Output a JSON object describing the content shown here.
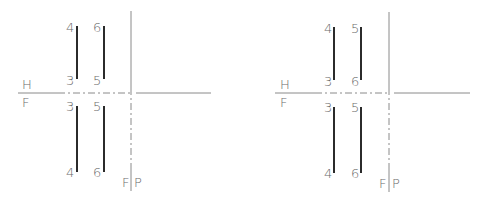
{
  "diagrams": [
    {
      "name": "left",
      "plane_labels": {
        "hf_top": "H",
        "hf_bottom": "F",
        "fp_left": "F",
        "fp_right": "P"
      },
      "top_view": {
        "line_a": {
          "top": "4",
          "bottom": "3"
        },
        "line_b": {
          "top": "6",
          "bottom": "5"
        }
      },
      "front_view": {
        "line_a": {
          "top": "3",
          "bottom": "4"
        },
        "line_b": {
          "top": "5",
          "bottom": "6"
        }
      }
    },
    {
      "name": "right",
      "plane_labels": {
        "hf_top": "H",
        "hf_bottom": "F",
        "fp_left": "F",
        "fp_right": "P"
      },
      "top_view": {
        "line_a": {
          "top": "4",
          "bottom": "3"
        },
        "line_b": {
          "top": "5",
          "bottom": "6"
        }
      },
      "front_view": {
        "line_a": {
          "top": "3",
          "bottom": "4"
        },
        "line_b": {
          "top": "5",
          "bottom": "6"
        }
      }
    }
  ],
  "colors": {
    "edge": "#2b2b2b",
    "reference_line": "#8a8a8a",
    "label": "#6b6b6b"
  }
}
